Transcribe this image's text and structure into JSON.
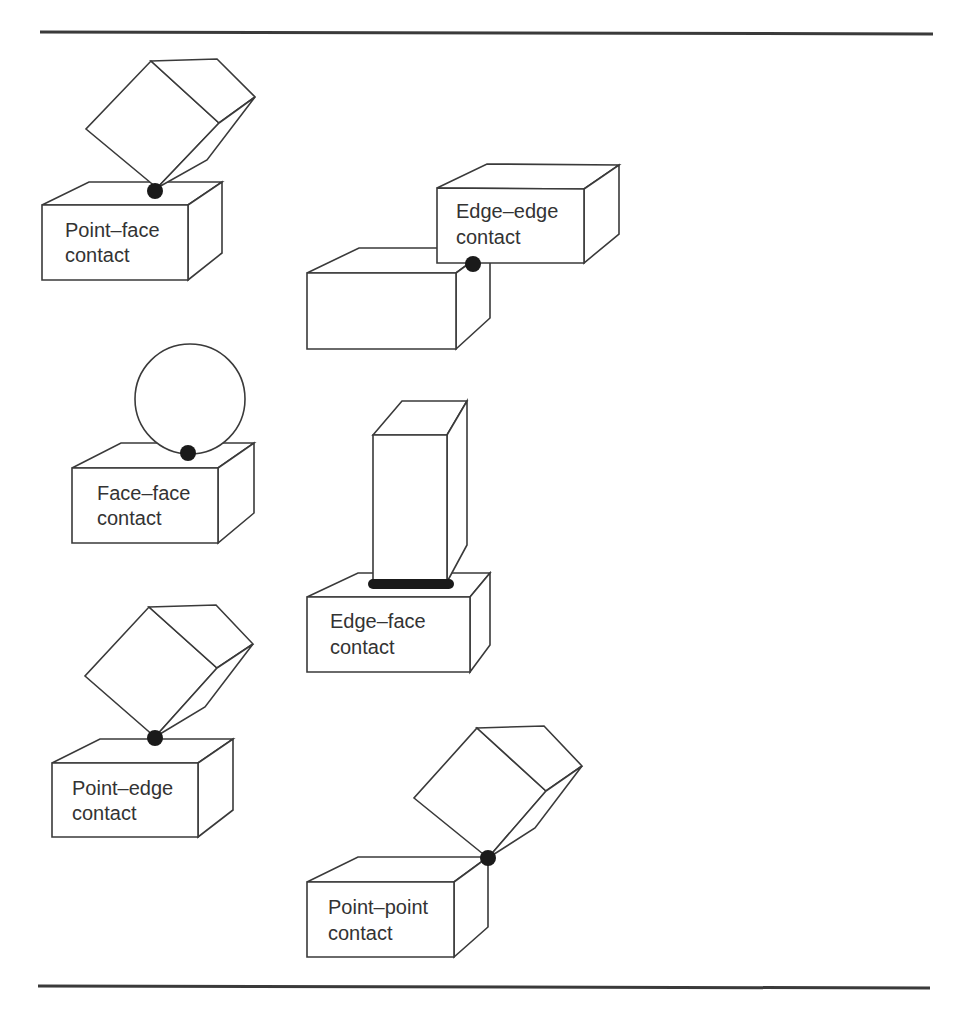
{
  "figure": {
    "colors": {
      "line": "#3a3a3a",
      "contact": "#1a1a1a",
      "text": "#333333",
      "background": "#ffffff"
    },
    "panels": [
      {
        "id": "point-face",
        "label_line1": "Point–face",
        "label_line2": "contact",
        "contact_type": "point"
      },
      {
        "id": "edge-edge",
        "label_line1": "Edge–edge",
        "label_line2": "contact",
        "contact_type": "point"
      },
      {
        "id": "face-face",
        "label_line1": "Face–face",
        "label_line2": "contact",
        "contact_type": "point"
      },
      {
        "id": "edge-face",
        "label_line1": "Edge–face",
        "label_line2": "contact",
        "contact_type": "line"
      },
      {
        "id": "point-edge",
        "label_line1": "Point–edge",
        "label_line2": "contact",
        "contact_type": "point"
      },
      {
        "id": "point-point",
        "label_line1": "Point–point",
        "label_line2": "contact",
        "contact_type": "point"
      }
    ]
  }
}
